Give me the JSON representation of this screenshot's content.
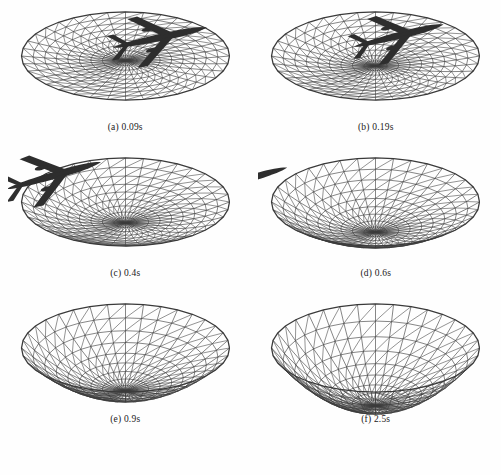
{
  "figure": {
    "title_partial": "",
    "background_color": "#fefefe",
    "mesh_color": "#3a3a3a",
    "aircraft_color": "#2e2e2e",
    "caption_color": "#1a1a1a",
    "layout": {
      "columns": 2,
      "rows": 3,
      "panel_count": 6
    }
  },
  "chart_data": {
    "type": "scatter",
    "xlabel": "",
    "ylabel": "",
    "categories": [
      "0.09s",
      "0.19s",
      "0.4s",
      "0.6s",
      "0.9s",
      "2.5s"
    ],
    "series": [
      {
        "name": "surface depth (normalized)",
        "values": [
          0.08,
          0.16,
          0.34,
          0.5,
          0.72,
          1.0
        ]
      },
      {
        "name": "aircraft visible",
        "values": [
          1,
          1,
          1,
          0.4,
          0,
          0
        ]
      }
    ],
    "annotations": [
      "Mesh is a radially triangulated circular membrane shown in oblique projection",
      "Aircraft silhouette translates left and exits the frame as the surface deepens"
    ],
    "grid": true,
    "legend_position": "none"
  },
  "panels": [
    {
      "id": "a",
      "label": "(a) 0.09s",
      "time": "0.09s",
      "depth": 0.08,
      "rings": 9,
      "spokes": 36,
      "aircraft": {
        "visible": true,
        "x": 150,
        "y": 38,
        "scale": 1.0,
        "rotation": -12,
        "clip": false
      }
    },
    {
      "id": "b",
      "label": "(b) 0.19s",
      "time": "0.19s",
      "depth": 0.17,
      "rings": 9,
      "spokes": 36,
      "aircraft": {
        "visible": true,
        "x": 139,
        "y": 36,
        "scale": 0.96,
        "rotation": -14,
        "clip": false
      }
    },
    {
      "id": "c",
      "label": "(c) 0.4s",
      "time": "0.4s",
      "depth": 0.36,
      "rings": 9,
      "spokes": 36,
      "aircraft": {
        "visible": true,
        "x": 44,
        "y": 30,
        "scale": 1.02,
        "rotation": -16,
        "clip": true
      }
    },
    {
      "id": "d",
      "label": "(d) 0.6s",
      "time": "0.6s",
      "depth": 0.52,
      "rings": 9,
      "spokes": 36,
      "aircraft": {
        "visible": true,
        "x": -14,
        "y": 34,
        "scale": 0.9,
        "rotation": -16,
        "clip": true
      }
    },
    {
      "id": "e",
      "label": "(e) 0.9s",
      "time": "0.9s",
      "depth": 0.74,
      "rings": 9,
      "spokes": 36,
      "aircraft": {
        "visible": false,
        "x": 0,
        "y": 0,
        "scale": 0,
        "rotation": 0,
        "clip": false
      }
    },
    {
      "id": "f",
      "label": "(f) 2.5s",
      "time": "2.5s",
      "depth": 1.0,
      "rings": 9,
      "spokes": 36,
      "aircraft": {
        "visible": false,
        "x": 0,
        "y": 0,
        "scale": 0,
        "rotation": 0,
        "clip": false
      }
    }
  ]
}
